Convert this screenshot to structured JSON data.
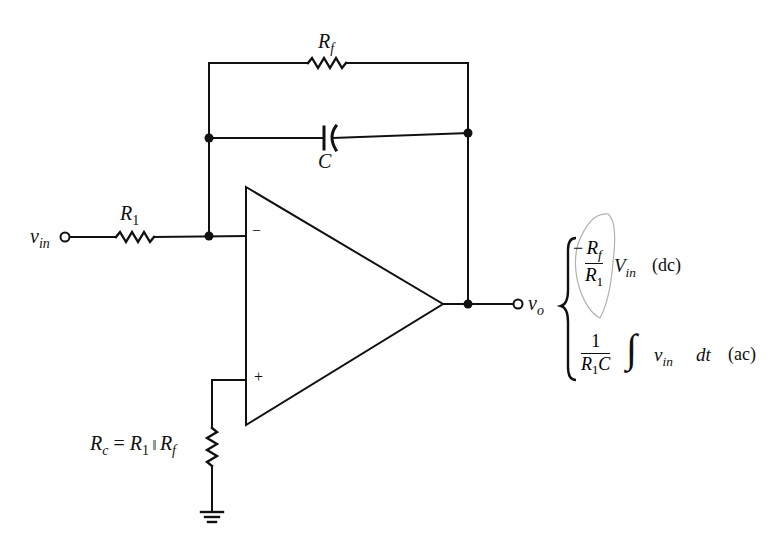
{
  "diagram": {
    "type": "circuit-schematic",
    "stroke_color": "#111111",
    "annotation_color": "#9a9a9a",
    "components": {
      "feedback_resistor": {
        "label_main": "R",
        "label_sub": "f"
      },
      "feedback_capacitor": {
        "label": "C"
      },
      "input_resistor": {
        "label_main": "R",
        "label_sub": "1"
      },
      "compensation_resistor": {
        "label_parts": [
          "R",
          "c",
          " = ",
          "R",
          "1",
          " ‖ ",
          "R",
          "f"
        ]
      },
      "op_amp": {
        "inverting_sign": "−",
        "noninverting_sign": "+"
      }
    },
    "terminals": {
      "input": {
        "label_main": "v",
        "label_sub": "in"
      },
      "output": {
        "label_main": "v",
        "label_sub": "o"
      }
    },
    "output_equations": {
      "dc": {
        "sign": "−",
        "numerator_main": "R",
        "numerator_sub": "f",
        "denominator_main": "R",
        "denominator_sub": "1",
        "variable_main": "V",
        "variable_sub": "in",
        "tag": "(dc)"
      },
      "ac": {
        "numerator": "1",
        "denominator_main": "R",
        "denominator_sub": "1",
        "denominator_tail": "C",
        "integral": "∫",
        "variable_main": "v",
        "variable_sub": "in",
        "differential": "dt",
        "tag": "(ac)"
      }
    }
  }
}
